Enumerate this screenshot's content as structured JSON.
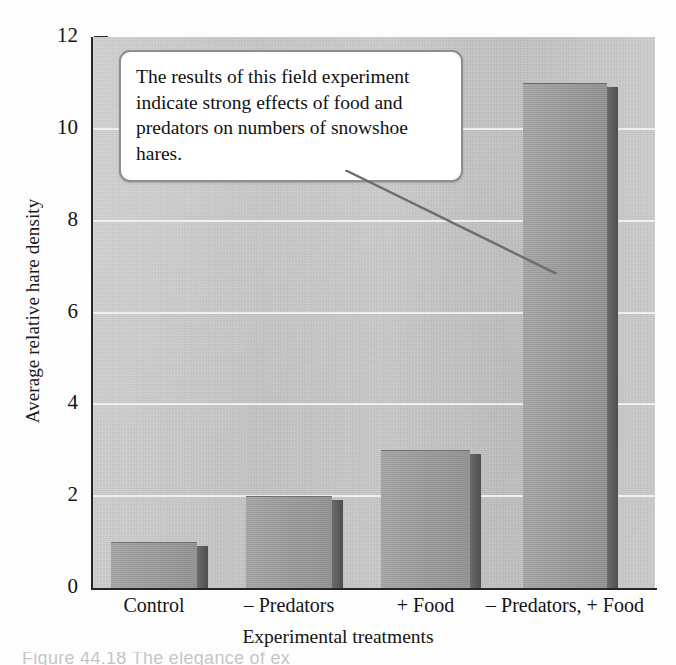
{
  "figure": {
    "background_color": "#fdfdfd",
    "plot_background_color": "#c9c9c9",
    "bar_color": "#9b9b9b",
    "bar_side_color": "#5f5f5f",
    "gridline_color": "#f2f2f2",
    "axis_color": "#262626"
  },
  "callout": {
    "text": "The results of this field experiment indicate strong effects of food and predators on numbers of snowshoe hares.",
    "border_color": "#8e8e8e",
    "background_color": "#ffffff"
  },
  "page_caption": {
    "text": "Figure 44.18   The elegance of ex"
  },
  "chart_data": {
    "type": "bar",
    "title": "",
    "categories": [
      "Control",
      "– Predators",
      "+ Food",
      "– Predators, + Food"
    ],
    "values": [
      1.0,
      2.0,
      3.0,
      11.0
    ],
    "xlabel": "Experimental treatments",
    "ylabel": "Average relative hare density",
    "ylim": [
      0,
      12
    ],
    "yticks": [
      0,
      2,
      4,
      6,
      8,
      10,
      12
    ],
    "ytick_labels": [
      "0",
      "2",
      "4",
      "6",
      "8",
      "10",
      "12"
    ],
    "grid": true,
    "grid_axis": "y",
    "legend": false,
    "style": "3d-shaded-bars"
  }
}
